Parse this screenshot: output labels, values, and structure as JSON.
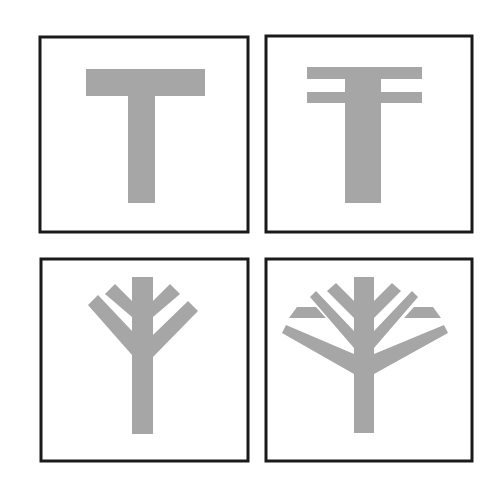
{
  "figure": {
    "colors": {
      "frame": "#1a1a1a",
      "glyph": "#a6a6a6",
      "background": "#ffffff"
    },
    "panels": [
      {
        "id": "panel-1",
        "label": "T shape",
        "frame": {
          "x": 40,
          "y": 37,
          "w": 208,
          "h": 195
        },
        "shapes": [
          "86,69 205,69 205,96 155,96 155,203 128,203 128,96 86,96"
        ]
      },
      {
        "id": "panel-2",
        "label": "T with double crossbar",
        "frame": {
          "x": 266,
          "y": 36,
          "w": 206,
          "h": 196
        },
        "shapes": [
          "307,67 422,67 422,79 307,79",
          "307,92 422,92 422,103 307,103",
          "345,67 381,67 381,203 345,203"
        ]
      },
      {
        "id": "panel-3",
        "label": "Tree with two branch pairs",
        "frame": {
          "x": 41,
          "y": 259,
          "w": 207,
          "h": 202
        },
        "shapes": [
          "132,277 153,277 153,434 132,434",
          "105,294 115,284 132,301 132,317",
          "88,305 98,295 132,331 132,355",
          "180,294 170,284 153,301 153,317",
          "198,311 188,301 153,335 153,357"
        ]
      },
      {
        "id": "panel-4",
        "label": "Tree with four branch pairs",
        "frame": {
          "x": 266,
          "y": 259,
          "w": 206,
          "h": 202
        },
        "shapes": [
          "354,277 374,277 374,433 354,433",
          "327,291 336,283 354,301 354,318",
          "310,297 316,291 354,331 354,348",
          "289,318 297,307 316,307 326,318",
          "282,333 286,325 354,354 354,374",
          "401,291 392,283 374,301 374,318",
          "418,297 412,291 374,331 374,348",
          "441,318 433,307 414,307 404,318",
          "448,333 444,325 374,354 374,374"
        ]
      }
    ]
  }
}
